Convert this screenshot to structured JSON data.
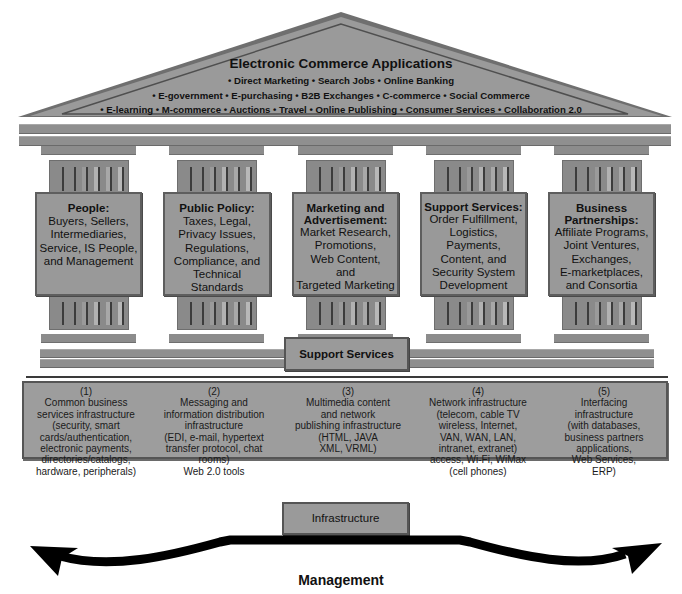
{
  "roof": {
    "title": "Electronic Commerce Applications",
    "lines": [
      "• Direct Marketing • Search Jobs • Online Banking",
      "• E-government • E-purchasing • B2B Exchanges • C-commerce • Social Commerce",
      "• E-learning • M-commerce • Auctions • Travel • Online Publishing • Consumer Services • Collaboration 2.0"
    ]
  },
  "pillars": [
    {
      "title": "People:",
      "body": [
        "Buyers, Sellers,",
        "Intermediaries,",
        "Service, IS People,",
        "and Management"
      ]
    },
    {
      "title": "Public Policy:",
      "body": [
        "Taxes, Legal,",
        "Privacy Issues,",
        "Regulations,",
        "Compliance, and",
        "Technical",
        "Standards"
      ]
    },
    {
      "title": "Marketing and Advertisement:",
      "title_lines": [
        "Marketing and",
        "Advertisement:"
      ],
      "body": [
        "Market Research,",
        "Promotions,",
        "Web Content,",
        "and",
        "Targeted Marketing"
      ]
    },
    {
      "title": "Support Services:",
      "body": [
        "Order Fulfillment,",
        "Logistics,",
        "Payments,",
        "Content, and",
        "Security System",
        "Development"
      ]
    },
    {
      "title": "Business Partnerships:",
      "title_lines": [
        "Business",
        "Partnerships:"
      ],
      "body": [
        "Affiliate Programs,",
        "Joint Ventures,",
        "Exchanges,",
        "E-marketplaces,",
        "and Consortia"
      ]
    }
  ],
  "support_services_label": "Support Services",
  "infrastructure": [
    {
      "num": "(1)",
      "lines": [
        "Common business",
        "services infrastructure",
        "(security, smart",
        "cards/authentication,",
        "electronic payments,",
        "directories/catalogs,",
        "hardware, peripherals)"
      ]
    },
    {
      "num": "(2)",
      "lines": [
        "Messaging and",
        "information distribution",
        "infrastructure",
        "(EDI, e-mail, hypertext",
        "transfer protocol, chat",
        "rooms)",
        "Web 2.0 tools"
      ]
    },
    {
      "num": "(3)",
      "lines": [
        "Multimedia content",
        "and network",
        "publishing infrastructure",
        "(HTML, JAVA",
        "XML, VRML)"
      ]
    },
    {
      "num": "(4)",
      "lines": [
        "Network infrastructure",
        "(telecom, cable TV",
        "wireless, Internet,",
        "VAN, WAN, LAN,",
        "intranet, extranet)",
        "access, Wi-Fi, WiMax",
        "(cell phones)"
      ]
    },
    {
      "num": "(5)",
      "lines": [
        "Interfacing",
        "infrastructure",
        "(with databases,",
        "business partners",
        "applications,",
        "Web Services,",
        "ERP)"
      ]
    }
  ],
  "infrastructure_label": "Infrastructure",
  "management_label": "Management",
  "colors": {
    "fill": "#999999",
    "border": "#555555",
    "arrow": "#000000"
  }
}
